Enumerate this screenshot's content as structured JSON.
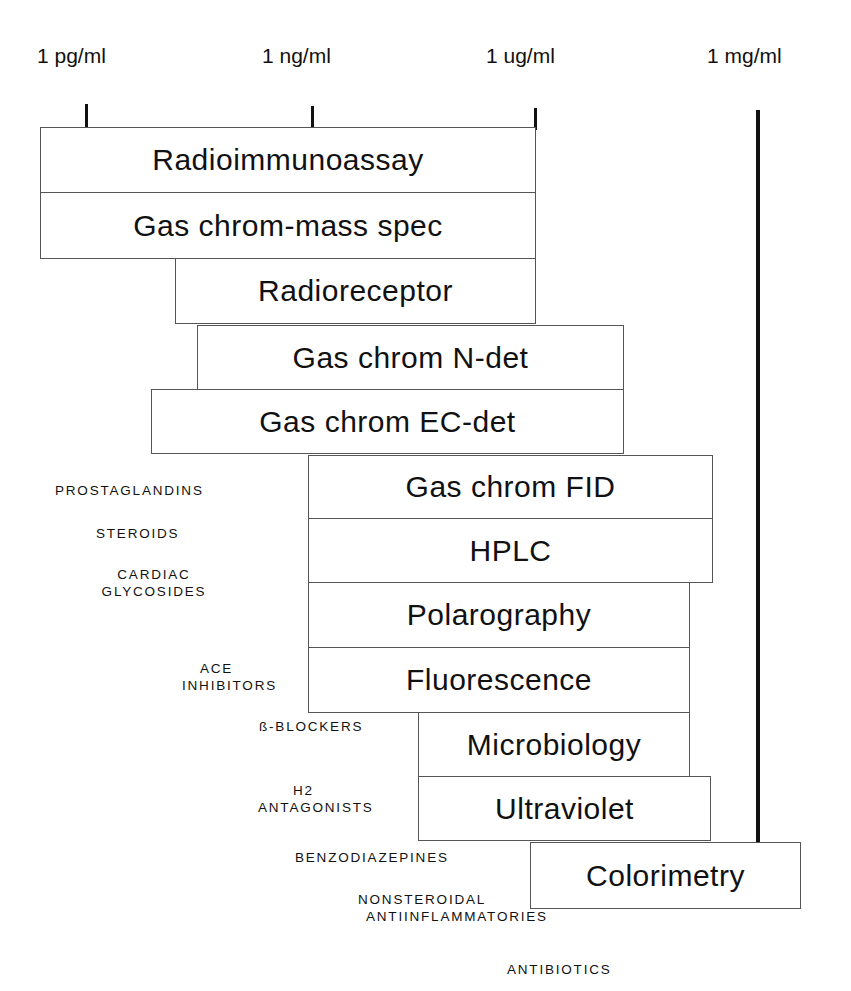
{
  "scale": {
    "labels": [
      "1 pg/ml",
      "1 ng/ml",
      "1 ug/ml",
      "1 mg/ml"
    ]
  },
  "methods": [
    "Radioimmunoassay",
    "Gas chrom-mass spec",
    "Radioreceptor",
    "Gas chrom N-det",
    "Gas chrom EC-det",
    "Gas chrom FID",
    "HPLC",
    "Polarography",
    "Fluorescence",
    "Microbiology",
    "Ultraviolet",
    "Colorimetry"
  ],
  "drug_classes": [
    "PROSTAGLANDINS",
    "STEROIDS",
    "CARDIAC",
    "GLYCOSIDES",
    "ACE",
    "INHIBITORS",
    "ß-BLOCKERS",
    "H2",
    "ANTAGONISTS",
    "BENZODIAZEPINES",
    "NONSTEROIDAL",
    "ANTIINFLAMMATORIES",
    "ANTIBIOTICS"
  ]
}
